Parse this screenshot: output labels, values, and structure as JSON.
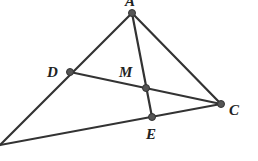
{
  "figure": {
    "type": "geometry-diagram",
    "points": [
      {
        "id": "A",
        "label": "A",
        "x": 132,
        "y": 13,
        "label_x": 125,
        "label_y": 6
      },
      {
        "id": "D",
        "label": "D",
        "x": 70,
        "y": 72,
        "label_x": 47,
        "label_y": 77
      },
      {
        "id": "M",
        "label": "M",
        "x": 146,
        "y": 88,
        "label_x": 119,
        "label_y": 77
      },
      {
        "id": "C",
        "label": "C",
        "x": 221,
        "y": 104,
        "label_x": 229,
        "label_y": 115
      },
      {
        "id": "E",
        "label": "E",
        "x": 152,
        "y": 117,
        "label_x": 146,
        "label_y": 139
      },
      {
        "id": "B",
        "label": "",
        "x": 0,
        "y": 145
      }
    ],
    "segments": [
      [
        "A",
        "B"
      ],
      [
        "A",
        "C"
      ],
      [
        "A",
        "E"
      ],
      [
        "D",
        "C"
      ],
      [
        "B",
        "C"
      ]
    ],
    "marked_points": [
      "A",
      "D",
      "M",
      "C",
      "E"
    ],
    "colors": {
      "stroke": "#333333",
      "point": "#555555",
      "label": "#222222"
    }
  }
}
